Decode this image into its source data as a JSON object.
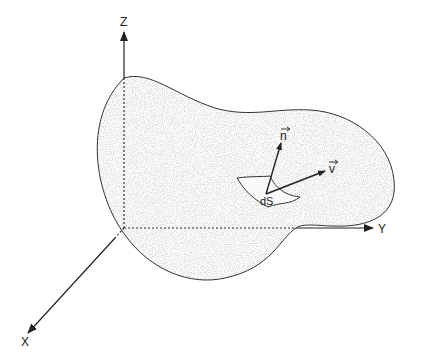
{
  "diagram": {
    "axes": {
      "z_label": "Z",
      "y_label": "Y",
      "x_label": "X"
    },
    "vectors": {
      "normal_label": "n",
      "velocity_label": "v"
    },
    "element_label": "dS",
    "colors": {
      "stroke": "#333333",
      "fill_speckle": "#d6d6d6",
      "background": "#ffffff"
    }
  }
}
